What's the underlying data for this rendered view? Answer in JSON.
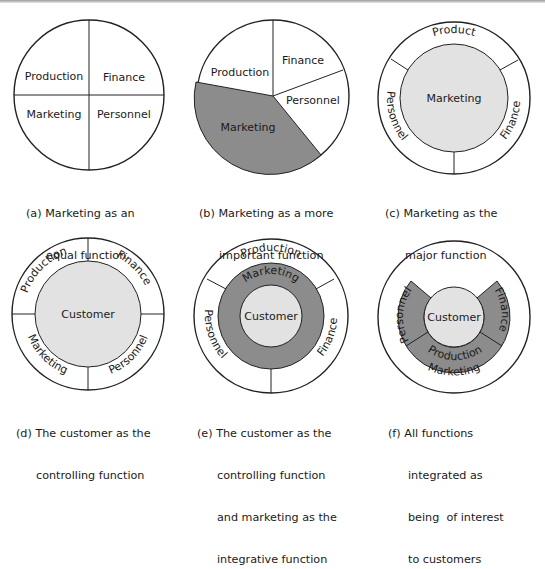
{
  "colors": {
    "dark_gray": "#8c8c8c",
    "light_gray": "#e2e2e2",
    "stroke": "#222222",
    "white": "#ffffff"
  },
  "diagrams": [
    {
      "id": "a",
      "segments": [
        "Production",
        "Finance",
        "Marketing",
        "Personnel"
      ],
      "caption_line1": "(a) Marketing as an",
      "caption_line2": "equal function"
    },
    {
      "id": "b",
      "segments": [
        "Production",
        "Finance",
        "Personnel",
        "Marketing"
      ],
      "caption_line1": "(b) Marketing as a more",
      "caption_line2": "important function"
    },
    {
      "id": "c",
      "center": "Marketing",
      "ring": [
        "Product",
        "Finance",
        "Personnel"
      ],
      "caption_line1": "(c) Marketing as the",
      "caption_line2": "major function"
    },
    {
      "id": "d",
      "center": "Customer",
      "ring": [
        "Production",
        "Finance",
        "Marketing",
        "Personnel"
      ],
      "caption_line1": "(d) The customer as the",
      "caption_line2": "controlling function"
    },
    {
      "id": "e",
      "center": "Customer",
      "middle_ring": "Marketing",
      "ring": [
        "Production",
        "Finance",
        "Personnel"
      ],
      "caption_line1": "(e) The customer as the",
      "caption_line2": "controlling function",
      "caption_line3": "and marketing as the",
      "caption_line4": "integrative function"
    },
    {
      "id": "f",
      "center": "Customer",
      "arc_segments": [
        "Personnel",
        "Production",
        "Finance"
      ],
      "outer": "Marketing",
      "caption_line1": "(f) All functions",
      "caption_line2": "integrated as",
      "caption_line3": "being  of interest",
      "caption_line4": "to customers"
    }
  ]
}
